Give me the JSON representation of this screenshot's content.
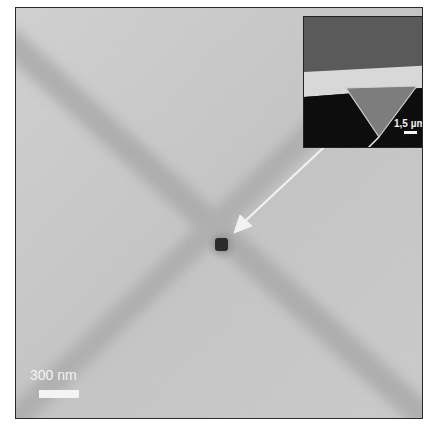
{
  "figure": {
    "type": "SEM micrograph",
    "scale_bar": {
      "label": "300 nm"
    },
    "inset": {
      "description": "Cantilever with inverted pyramidal (triangular) tip",
      "scale_bar": {
        "label": "1,5 µm"
      }
    },
    "colors": {
      "background": "#c9c9c9",
      "band": "#a8a8a8",
      "defect": "#2b2b2b",
      "arrow": "#f2f2f2",
      "inset_dark": "#111111",
      "inset_top": "#5a5a5a",
      "inset_ledge": "#d8d8d8",
      "inset_tip": "#7d7d7d"
    }
  }
}
